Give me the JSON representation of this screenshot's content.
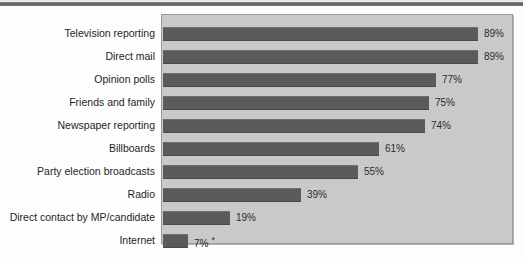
{
  "chart_data": {
    "type": "bar",
    "orientation": "horizontal",
    "title": "",
    "subtitle": "",
    "xlabel": "",
    "ylabel": "",
    "xlim": [
      0,
      100
    ],
    "grid": false,
    "legend": null,
    "bar_color": "#5b5b5b",
    "plot_background": "#c9c9c9",
    "categories": [
      "Television reporting",
      "Direct mail",
      "Opinion polls",
      "Friends and family",
      "Newspaper reporting",
      "Billboards",
      "Party election broadcasts",
      "Radio",
      "Direct contact by MP/candidate",
      "Internet"
    ],
    "values": [
      89,
      89,
      77,
      75,
      74,
      61,
      55,
      39,
      19,
      7
    ],
    "value_labels": [
      "89%",
      "89%",
      "77%",
      "75%",
      "74%",
      "61%",
      "55%",
      "39%",
      "19%",
      "7%"
    ],
    "annotations": [
      {
        "category": "Internet",
        "marker": "*"
      }
    ],
    "footnote_marker": "*"
  },
  "ghost": {
    "text": ""
  }
}
